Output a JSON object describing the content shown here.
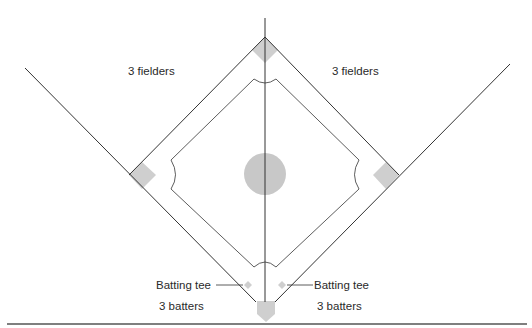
{
  "diagram": {
    "labels": {
      "fielders_left": "3 fielders",
      "fielders_right": "3 fielders",
      "tee_left": "Batting tee",
      "tee_right": "Batting tee",
      "batters_left": "3 batters",
      "batters_right": "3 batters"
    },
    "colors": {
      "line": "#333333",
      "base_fill": "#cfcfcf",
      "mound_fill": "#c8c8c8",
      "background": "#ffffff"
    }
  }
}
